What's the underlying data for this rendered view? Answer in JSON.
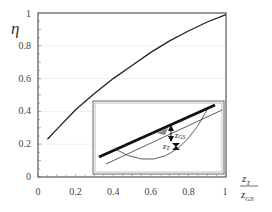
{
  "chart_data": {
    "type": "line",
    "title": "",
    "xlabel": "z_T / z_GS",
    "ylabel": "η",
    "xlim": [
      0,
      1
    ],
    "ylim": [
      0,
      1
    ],
    "grid": true,
    "legend": null,
    "x_ticks": [
      "0",
      "0.2",
      "0.4",
      "0.6",
      "0.8",
      "1"
    ],
    "y_ticks": [
      "0",
      "0.2",
      "0.4",
      "0.6",
      "0.8",
      "1"
    ],
    "series": [
      {
        "name": "η",
        "x": [
          0.05,
          0.1,
          0.2,
          0.3,
          0.4,
          0.5,
          0.6,
          0.7,
          0.8,
          0.9,
          1.0
        ],
        "values": [
          0.23,
          0.29,
          0.41,
          0.51,
          0.6,
          0.68,
          0.76,
          0.83,
          0.89,
          0.945,
          0.99
        ]
      }
    ],
    "inset": {
      "description": "schematic of slope surface with water table and failure circle",
      "labels": [
        "z_GS",
        "z_T"
      ]
    }
  },
  "labels": {
    "y_axis": "η",
    "x_num": "z",
    "x_num_sub": "T",
    "x_den": "z",
    "x_den_sub": "GS",
    "inset_zgs": "z",
    "inset_zgs_sub": "GS",
    "inset_zt": "z",
    "inset_zt_sub": "T"
  },
  "colors": {
    "axis": "#555555",
    "curve": "#222222",
    "grid": "#eeeeee",
    "inset_border": "#666666"
  }
}
